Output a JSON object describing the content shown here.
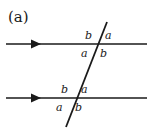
{
  "figure": {
    "caption": "(a)",
    "colors": {
      "stroke": "#1a1a1a",
      "background": "#ffffff",
      "text": "#1a1a1a"
    },
    "lines": {
      "upper_parallel": {
        "name": "upper parallel line",
        "x1": 6,
        "y1": 44,
        "x2": 147,
        "y2": 44,
        "direction_marker": "right-arrowhead"
      },
      "lower_parallel": {
        "name": "lower parallel line",
        "x1": 6,
        "y1": 98,
        "x2": 147,
        "y2": 98,
        "direction_marker": "right-arrowhead"
      },
      "transversal": {
        "name": "transversal line",
        "x1": 107,
        "y1": 22,
        "x2": 66,
        "y2": 127
      }
    },
    "arrowheads": [
      {
        "name": "upper-line-arrowhead",
        "x": 40,
        "y": 44
      },
      {
        "name": "lower-line-arrowhead",
        "x": 40,
        "y": 98
      }
    ],
    "intersections": [
      {
        "name": "upper-intersection",
        "x": 98,
        "y": 44,
        "angles": [
          {
            "position": "top-left",
            "label": "b",
            "x": 85,
            "y": 30
          },
          {
            "position": "top-right",
            "label": "a",
            "x": 105,
            "y": 30
          },
          {
            "position": "bottom-left",
            "label": "a",
            "x": 81,
            "y": 48
          },
          {
            "position": "bottom-right",
            "label": "b",
            "x": 100,
            "y": 48
          }
        ]
      },
      {
        "name": "lower-intersection",
        "x": 77,
        "y": 98,
        "angles": [
          {
            "position": "top-left",
            "label": "b",
            "x": 61,
            "y": 84
          },
          {
            "position": "top-right",
            "label": "a",
            "x": 81,
            "y": 84
          },
          {
            "position": "bottom-left",
            "label": "a",
            "x": 56,
            "y": 102
          },
          {
            "position": "bottom-right",
            "label": "b",
            "x": 75,
            "y": 102
          }
        ]
      }
    ]
  }
}
